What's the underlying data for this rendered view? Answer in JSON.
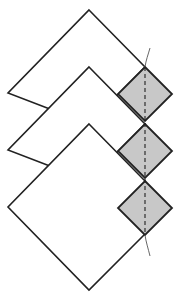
{
  "diagram": {
    "colors": {
      "background": "#ffffff",
      "stroke": "#222222",
      "shaded_fill": "#c8c8c8",
      "thin_curve": "#555555"
    },
    "large_diamonds": [
      {
        "id": "top",
        "points": "89,10 145,67 89,124 8,93"
      },
      {
        "id": "middle",
        "points": "89,67 145,124 89,181 8,150"
      },
      {
        "id": "bottom",
        "points": "89,124 145,181 145,234 89,290 8,207"
      }
    ],
    "shaded_diamonds": [
      {
        "id": "shaded-1",
        "cx": 145,
        "cy": 94,
        "r": 27
      },
      {
        "id": "shaded-2",
        "cx": 145,
        "cy": 151,
        "r": 27
      },
      {
        "id": "shaded-3",
        "cx": 145,
        "cy": 208,
        "r": 27
      }
    ],
    "dashed_line": {
      "x": 145,
      "y1": 67,
      "y2": 235
    },
    "curves": [
      {
        "id": "top-curve",
        "d": "M145,67 C146,60 148,55 150,48"
      },
      {
        "id": "bottom-curve",
        "d": "M145,235 C146,242 148,248 150,256"
      }
    ]
  }
}
